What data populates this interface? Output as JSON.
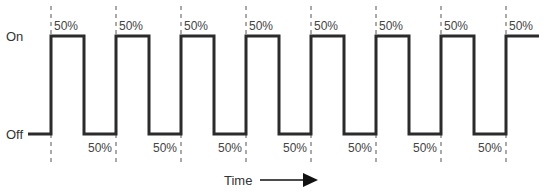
{
  "diagram": {
    "type": "pwm-square-wave",
    "y_labels": {
      "on": "On",
      "off": "Off"
    },
    "x_label": "Time",
    "duty_label": "50%",
    "cycles": 8,
    "high_labels": [
      "50%",
      "50%",
      "50%",
      "50%",
      "50%",
      "50%",
      "50%",
      "50%"
    ],
    "low_labels": [
      "50%",
      "50%",
      "50%",
      "50%",
      "50%",
      "50%",
      "50%"
    ],
    "colors": {
      "wave": "#2b2b2b",
      "dash": "#555555",
      "text": "#444444"
    }
  }
}
